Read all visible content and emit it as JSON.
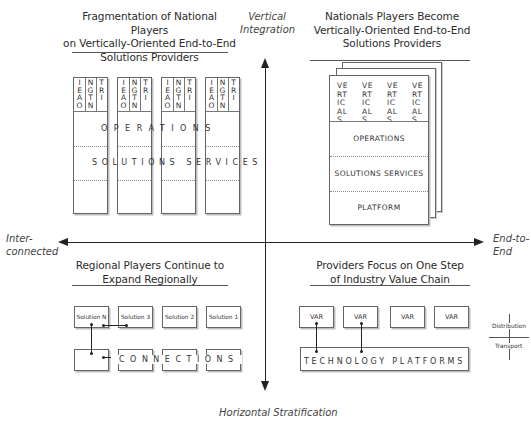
{
  "axes": {
    "top": "Vertical Integration",
    "top_lines": [
      "Vertical",
      "Integration"
    ],
    "bottom": "Horizontal Stratification",
    "left_lines": [
      "Inter-",
      "connected"
    ],
    "right_lines": [
      "End-to-",
      "End"
    ]
  },
  "quadrants": {
    "top_left": {
      "title_lines": [
        "Fragmentation of National Players",
        "on Vertically-Oriented End-to-End",
        "Solutions Providers"
      ],
      "column_header_letters": [
        [
          "I",
          "E",
          "A",
          "O"
        ],
        [
          "N",
          "G",
          "T",
          "N"
        ],
        [
          "T",
          "R",
          "I"
        ]
      ],
      "column_count": 4,
      "band_operations": "OPERATIONS",
      "band_solutions": "SOLUTIONS SERVICES"
    },
    "top_right": {
      "title_lines": [
        "Nationals Players Become",
        "Vertically-Oriented End-to-End",
        "Solutions Providers"
      ],
      "verticals_label_lines": [
        "VE",
        "RT",
        "IC",
        "AL",
        "S"
      ],
      "verticals_count": 4,
      "layers": [
        "OPERATIONS",
        "SOLUTIONS SERVICES",
        "PLATFORM"
      ]
    },
    "bottom_left": {
      "title_lines": [
        "Regional Players Continue to",
        "Expand Regionally"
      ],
      "solutions": [
        "Solution N",
        "Solution 3",
        "Solution 2",
        "Solution 1"
      ],
      "connections_label": "CONNECTIONS"
    },
    "bottom_right": {
      "title_lines": [
        "Providers Focus on One Step",
        "of Industry Value Chain"
      ],
      "vars": [
        "VAR",
        "VAR",
        "VAR",
        "VAR"
      ],
      "platform_label": "TECHNOLOGY PLATFORMS",
      "legend": {
        "upper": "Distribution",
        "lower": "Transport"
      }
    }
  }
}
